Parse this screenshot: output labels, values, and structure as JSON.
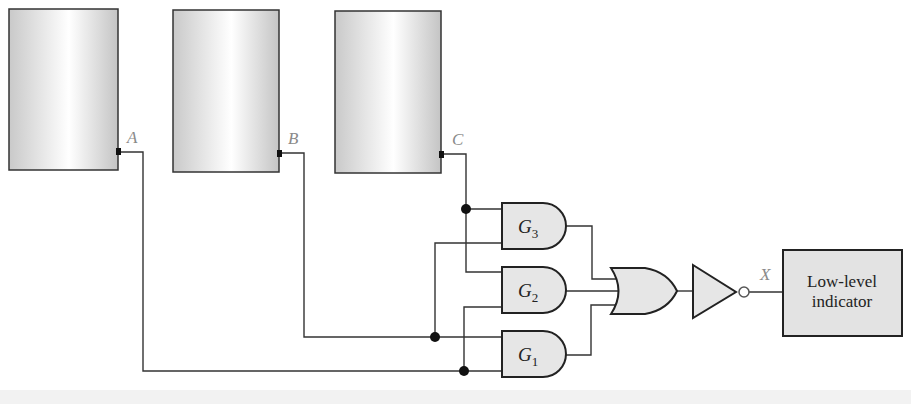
{
  "diagram": {
    "tanks": [
      {
        "id": "A",
        "label": "A"
      },
      {
        "id": "B",
        "label": "B"
      },
      {
        "id": "C",
        "label": "C"
      }
    ],
    "gates": [
      {
        "id": "G3",
        "name": "G",
        "sub": "3",
        "type": "AND",
        "inputs": [
          "C",
          "A"
        ]
      },
      {
        "id": "G2",
        "name": "G",
        "sub": "2",
        "type": "AND",
        "inputs": [
          "C",
          "B"
        ]
      },
      {
        "id": "G1",
        "name": "G",
        "sub": "1",
        "type": "AND",
        "inputs": [
          "A",
          "B"
        ]
      }
    ],
    "or_gate": {
      "type": "OR",
      "inputs": [
        "G3",
        "G2",
        "G1"
      ]
    },
    "inverter": {
      "type": "NOT"
    },
    "output": {
      "label": "X"
    },
    "indicator": {
      "line1": "Low-level",
      "line2": "indicator"
    },
    "colors": {
      "wire": "#333333",
      "gate_fill": "#e6e6e6",
      "tank_edge": "#c8c8c8",
      "tank_center": "#ffffff",
      "label_gray": "#8a8a8a"
    }
  }
}
